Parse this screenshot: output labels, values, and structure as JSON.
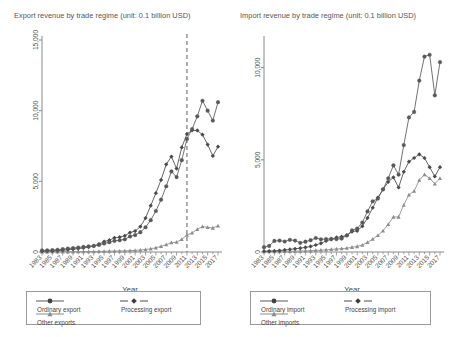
{
  "panels": [
    {
      "key": "export",
      "title": "Export revenue by trade regime (unit: 0.1 billion USD)",
      "xlabel": "Year",
      "legend": {
        "ordinary": "Ordinary export",
        "processing": "Processing export",
        "other": "Other exports"
      }
    },
    {
      "key": "import",
      "title": "Import revenue by trade regime (unit: 0.1 billion USD)",
      "xlabel": "Year",
      "legend": {
        "ordinary": "Ordinary import",
        "processing": "Processing import",
        "other": "Other imports"
      }
    }
  ],
  "colors": {
    "ordinary": "#595959",
    "processing": "#4a4a4a",
    "other": "#8c8c8c",
    "axis": "#8a8a8a",
    "dashed": "#6b6b6b"
  },
  "chart_data": [
    {
      "type": "line",
      "title": "Export revenue by trade regime (unit: 0.1 billion USD)",
      "xlabel": "Year",
      "ylabel": "",
      "grid": false,
      "legend_position": "bottom",
      "xlim": [
        1983,
        2017
      ],
      "ylim": [
        0,
        15000
      ],
      "yticks": [
        0,
        5000,
        10000,
        15000
      ],
      "ytick_labels": [
        "0",
        "5,000",
        "10,000",
        "15,000"
      ],
      "xticks": [
        1983,
        1985,
        1987,
        1989,
        1991,
        1993,
        1995,
        1997,
        1999,
        2001,
        2003,
        2005,
        2007,
        2009,
        2011,
        2013,
        2015,
        2017
      ],
      "xtick_labels": [
        "1983",
        "1985",
        "1987",
        "1989",
        "1991",
        "1993",
        "1995",
        "1997",
        "1999",
        "2001",
        "2003",
        "2005",
        "2007",
        "2009",
        "2011",
        "2013",
        "2015",
        "2017"
      ],
      "annotations": [
        {
          "type": "vline",
          "x": 2011,
          "style": "dashed"
        }
      ],
      "x": [
        1983,
        1984,
        1985,
        1986,
        1987,
        1988,
        1989,
        1990,
        1991,
        1992,
        1993,
        1994,
        1995,
        1996,
        1997,
        1998,
        1999,
        2000,
        2001,
        2002,
        2003,
        2004,
        2005,
        2006,
        2007,
        2008,
        2009,
        2010,
        2011,
        2012,
        2013,
        2014,
        2015,
        2016,
        2017
      ],
      "series": [
        {
          "name": "Ordinary export",
          "marker": "circle",
          "values": [
            110,
            120,
            130,
            160,
            200,
            240,
            280,
            320,
            360,
            400,
            430,
            500,
            600,
            690,
            790,
            830,
            900,
            1100,
            1200,
            1400,
            1750,
            2250,
            2900,
            3700,
            4650,
            5700,
            5300,
            6500,
            8000,
            8700,
            9600,
            10700,
            10000,
            9300,
            10600
          ]
        },
        {
          "name": "Processing export",
          "marker": "diamond",
          "values": [
            60,
            70,
            80,
            100,
            130,
            160,
            200,
            240,
            290,
            350,
            430,
            560,
            740,
            840,
            1000,
            1050,
            1150,
            1380,
            1480,
            1800,
            2400,
            3280,
            4160,
            5100,
            6200,
            6750,
            5900,
            7400,
            8350,
            8600,
            8600,
            8300,
            7600,
            6800,
            7450
          ]
        },
        {
          "name": "Other exports",
          "marker": "triangle",
          "values": [
            10,
            10,
            12,
            14,
            16,
            18,
            20,
            23,
            26,
            30,
            35,
            42,
            50,
            58,
            66,
            72,
            80,
            95,
            110,
            135,
            175,
            230,
            300,
            400,
            520,
            660,
            700,
            900,
            1200,
            1350,
            1600,
            1800,
            1750,
            1700,
            1850
          ]
        }
      ]
    },
    {
      "type": "line",
      "title": "Import revenue by trade regime (unit: 0.1 billion USD)",
      "xlabel": "Year",
      "ylabel": "",
      "grid": false,
      "legend_position": "bottom",
      "xlim": [
        1983,
        2017
      ],
      "ylim": [
        0,
        11500
      ],
      "yticks": [
        0,
        5000,
        10000
      ],
      "ytick_labels": [
        "0",
        "5,000",
        "10,000"
      ],
      "xticks": [
        1983,
        1985,
        1987,
        1989,
        1991,
        1993,
        1995,
        1997,
        1999,
        2001,
        2003,
        2005,
        2007,
        2009,
        2011,
        2013,
        2015,
        2017
      ],
      "xtick_labels": [
        "1983",
        "1985",
        "1987",
        "1989",
        "1991",
        "1993",
        "1995",
        "1997",
        "1999",
        "2001",
        "2003",
        "2005",
        "2007",
        "2009",
        "2011",
        "2013",
        "2015",
        "2017"
      ],
      "annotations": [],
      "x": [
        1983,
        1984,
        1985,
        1986,
        1987,
        1988,
        1989,
        1990,
        1991,
        1992,
        1993,
        1994,
        1995,
        1996,
        1997,
        1998,
        1999,
        2000,
        2001,
        2002,
        2003,
        2004,
        2005,
        2006,
        2007,
        2008,
        2009,
        2010,
        2011,
        2012,
        2013,
        2014,
        2015,
        2016,
        2017
      ],
      "series": [
        {
          "name": "Ordinary import",
          "marker": "circle",
          "values": [
            260,
            330,
            600,
            620,
            570,
            660,
            620,
            500,
            560,
            640,
            760,
            690,
            700,
            720,
            700,
            730,
            900,
            1180,
            1270,
            1600,
            2200,
            2750,
            2900,
            3400,
            4000,
            4700,
            4200,
            5800,
            7300,
            7600,
            9300,
            10600,
            10700,
            8500,
            10300
          ]
        },
        {
          "name": "Processing import",
          "marker": "diamond",
          "values": [
            40,
            50,
            60,
            80,
            110,
            140,
            175,
            210,
            250,
            300,
            380,
            470,
            600,
            680,
            790,
            830,
            900,
            1100,
            1150,
            1400,
            1850,
            2400,
            2950,
            3400,
            3800,
            4050,
            3500,
            4350,
            4900,
            5100,
            5300,
            5100,
            4600,
            4100,
            4600
          ]
        },
        {
          "name": "Other imports",
          "marker": "triangle",
          "values": [
            20,
            20,
            25,
            30,
            35,
            40,
            45,
            52,
            60,
            70,
            85,
            100,
            120,
            140,
            165,
            180,
            210,
            260,
            300,
            380,
            520,
            700,
            900,
            1150,
            1500,
            1900,
            1900,
            2550,
            3100,
            3300,
            3900,
            4200,
            4000,
            3700,
            4000
          ]
        }
      ]
    }
  ]
}
